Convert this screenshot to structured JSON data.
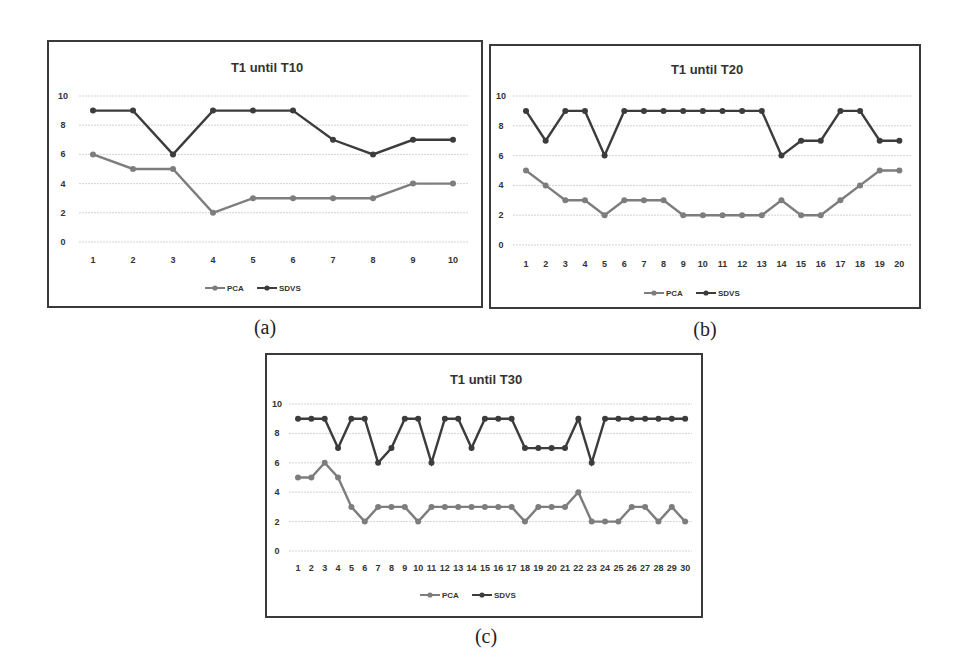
{
  "figure": {
    "captions": [
      "(a)",
      "(b)",
      "(c)"
    ]
  },
  "colors": {
    "PCA": "#7d7d7d",
    "SDVS": "#3c3c3c",
    "grid": "#c8c8c8",
    "frame": "#3a3a3a"
  },
  "chart_data": [
    {
      "type": "line",
      "title": "T1 until T10",
      "caption": "(a)",
      "xlabel": "",
      "ylabel": "",
      "ylim": [
        0,
        10
      ],
      "yticks": [
        0,
        2,
        4,
        6,
        8,
        10
      ],
      "grid": true,
      "legend_position": "bottom",
      "x": [
        1,
        2,
        3,
        4,
        5,
        6,
        7,
        8,
        9,
        10
      ],
      "series": [
        {
          "name": "PCA",
          "values": [
            6,
            5,
            5,
            2,
            3,
            3,
            3,
            3,
            4,
            4
          ]
        },
        {
          "name": "SDVS",
          "values": [
            9,
            9,
            6,
            9,
            9,
            9,
            7,
            6,
            7,
            7
          ]
        }
      ]
    },
    {
      "type": "line",
      "title": "T1 until T20",
      "caption": "(b)",
      "xlabel": "",
      "ylabel": "",
      "ylim": [
        0,
        10
      ],
      "yticks": [
        0,
        2,
        4,
        6,
        8,
        10
      ],
      "grid": true,
      "legend_position": "bottom",
      "x": [
        1,
        2,
        3,
        4,
        5,
        6,
        7,
        8,
        9,
        10,
        11,
        12,
        13,
        14,
        15,
        16,
        17,
        18,
        19,
        20
      ],
      "series": [
        {
          "name": "PCA",
          "values": [
            5,
            4,
            3,
            3,
            2,
            3,
            3,
            3,
            2,
            2,
            2,
            2,
            2,
            3,
            2,
            2,
            3,
            4,
            5,
            5
          ]
        },
        {
          "name": "SDVS",
          "values": [
            9,
            7,
            9,
            9,
            6,
            9,
            9,
            9,
            9,
            9,
            9,
            9,
            9,
            6,
            7,
            7,
            9,
            9,
            7,
            7
          ]
        }
      ]
    },
    {
      "type": "line",
      "title": "T1 until T30",
      "caption": "(c)",
      "xlabel": "",
      "ylabel": "",
      "ylim": [
        0,
        10
      ],
      "yticks": [
        0,
        2,
        4,
        6,
        8,
        10
      ],
      "grid": true,
      "legend_position": "bottom",
      "x": [
        1,
        2,
        3,
        4,
        5,
        6,
        7,
        8,
        9,
        10,
        11,
        12,
        13,
        14,
        15,
        16,
        17,
        18,
        19,
        20,
        21,
        22,
        23,
        24,
        25,
        26,
        27,
        28,
        29,
        30
      ],
      "series": [
        {
          "name": "PCA",
          "values": [
            5,
            5,
            6,
            5,
            3,
            2,
            3,
            3,
            3,
            2,
            3,
            3,
            3,
            3,
            3,
            3,
            3,
            2,
            3,
            3,
            3,
            4,
            2,
            2,
            2,
            3,
            3,
            2,
            3,
            2
          ]
        },
        {
          "name": "SDVS",
          "values": [
            9,
            9,
            9,
            7,
            9,
            9,
            6,
            7,
            9,
            9,
            6,
            9,
            9,
            7,
            9,
            9,
            9,
            7,
            7,
            7,
            7,
            9,
            6,
            9,
            9,
            9,
            9,
            9,
            9,
            9
          ]
        }
      ]
    }
  ]
}
